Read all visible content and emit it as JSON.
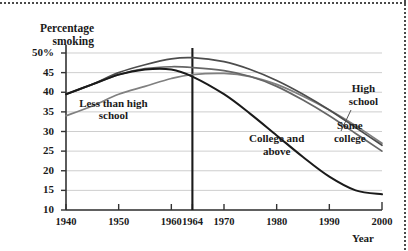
{
  "chart_data": {
    "type": "line",
    "title": "",
    "xlabel": "Year",
    "ylabel": "Percentage smoking",
    "xlim": [
      1940,
      2000
    ],
    "ylim": [
      10,
      50
    ],
    "grid": true,
    "legend_position": "inline-annotations",
    "xticks": [
      "1940",
      "1950",
      "1960",
      "1964",
      "1970",
      "1980",
      "1990",
      "2000"
    ],
    "xtick_values": [
      1940,
      1950,
      1960,
      1964,
      1970,
      1980,
      1990,
      2000
    ],
    "yticks": [
      "10",
      "15",
      "20",
      "25",
      "30",
      "35",
      "40",
      "45",
      "50%"
    ],
    "ytick_values": [
      10,
      15,
      20,
      25,
      30,
      35,
      40,
      45,
      50
    ],
    "annotations": [
      {
        "text": "Less than high school",
        "x": 1949,
        "y": 35.5
      },
      {
        "text": "College and above",
        "x": 1980,
        "y": 26.5
      },
      {
        "text": "High school",
        "x": 1994,
        "y": 37.5
      },
      {
        "text": "Some college",
        "x": 1992,
        "y": 29.5
      },
      {
        "text": "1964 Surgeon General report marker",
        "x": 1964,
        "y": 50
      }
    ],
    "reference_line": {
      "x": 1964,
      "label": "1964"
    },
    "series": [
      {
        "name": "Less than high school",
        "color": "#808080",
        "x": [
          1940,
          1945,
          1950,
          1955,
          1960,
          1964,
          1970,
          1975,
          1980,
          1985,
          1990,
          1995,
          2000
        ],
        "values": [
          34.0,
          36.5,
          39.5,
          41.5,
          43.5,
          44.5,
          44.8,
          44.0,
          42.0,
          39.0,
          35.5,
          31.5,
          27.0
        ]
      },
      {
        "name": "High school",
        "color": "#4d4d4d",
        "x": [
          1940,
          1945,
          1950,
          1955,
          1960,
          1964,
          1970,
          1975,
          1980,
          1985,
          1990,
          1995,
          2000
        ],
        "values": [
          39.5,
          42.0,
          45.0,
          47.0,
          48.5,
          48.8,
          47.8,
          45.8,
          43.0,
          39.5,
          35.5,
          31.0,
          26.5
        ]
      },
      {
        "name": "Some college",
        "color": "#666666",
        "x": [
          1940,
          1945,
          1950,
          1955,
          1960,
          1964,
          1970,
          1975,
          1980,
          1985,
          1990,
          1995,
          2000
        ],
        "values": [
          39.5,
          42.0,
          44.5,
          46.0,
          46.5,
          46.3,
          45.5,
          44.0,
          41.5,
          38.0,
          34.0,
          29.5,
          25.0
        ]
      },
      {
        "name": "College and above",
        "color": "#1a1a1a",
        "x": [
          1940,
          1945,
          1950,
          1955,
          1960,
          1964,
          1970,
          1975,
          1980,
          1985,
          1990,
          1995,
          2000
        ],
        "values": [
          39.5,
          42.0,
          44.5,
          45.8,
          45.8,
          44.0,
          39.5,
          34.5,
          29.0,
          23.5,
          18.5,
          15.0,
          14.0
        ]
      }
    ]
  }
}
